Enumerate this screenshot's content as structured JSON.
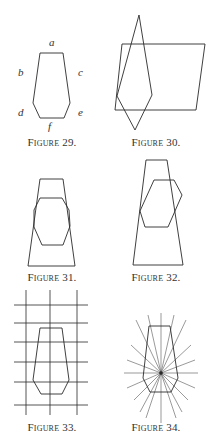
{
  "figures": [
    {
      "id": "29",
      "caption": "Figure 29.",
      "labels": {
        "a": "a",
        "b": "b",
        "c": "c",
        "d": "d",
        "e": "e",
        "f": "f"
      }
    },
    {
      "id": "30",
      "caption": "Figure 30."
    },
    {
      "id": "31",
      "caption": "Figure 31."
    },
    {
      "id": "32",
      "caption": "Figure 32."
    },
    {
      "id": "33",
      "caption": "Figure 33."
    },
    {
      "id": "34",
      "caption": "Figure 34."
    }
  ],
  "colors": {
    "stroke": "#2a2a2a",
    "background": "#ffffff",
    "text": "#333333"
  }
}
